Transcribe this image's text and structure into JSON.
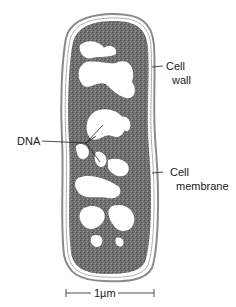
{
  "diagram": {
    "labels": {
      "cell_wall_line1": "Cell",
      "cell_wall_line2": "wall",
      "dna": "DNA",
      "cell_membrane_line1": "Cell",
      "cell_membrane_line2": "membrane"
    },
    "scale_bar": {
      "label": "1µm"
    },
    "colors": {
      "cytoplasm": "#6e6e6e",
      "cytoplasm_dark": "#4a4a4a",
      "wall": "#8a8a8a",
      "nucleoid_light": "#ffffff",
      "line": "#222222"
    }
  }
}
